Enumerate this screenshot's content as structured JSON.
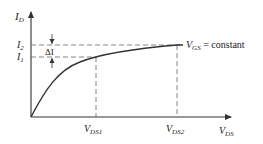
{
  "diagram": {
    "type": "MOSFET output characteristic (ID vs VDS)",
    "y_axis": {
      "label_main": "I",
      "label_sub": "D"
    },
    "x_axis": {
      "label_main": "V",
      "label_sub": "DS"
    },
    "levels": {
      "i2": {
        "main": "I",
        "sub": "2"
      },
      "i1": {
        "main": "I",
        "sub": "1"
      },
      "delta": "ΔI"
    },
    "markers": {
      "vds1": {
        "main": "V",
        "sub": "DS1"
      },
      "vds2": {
        "main": "V",
        "sub": "DS2"
      }
    },
    "curve_label": {
      "main": "V",
      "sub": "GS",
      "rest": " = constant"
    },
    "colors": {
      "line": "#333333",
      "dash": "#666666",
      "text": "#222222"
    }
  }
}
